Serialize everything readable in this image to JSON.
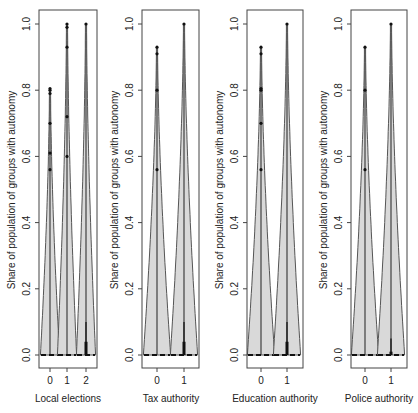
{
  "figure": {
    "ylabel": "Share of population of groups with autonomy",
    "y_ticks": [
      "0.0",
      "0.2",
      "0.4",
      "0.6",
      "0.8",
      "1.0"
    ]
  },
  "chart_data": [
    {
      "type": "violin",
      "xlabel": "Local elections",
      "ylabel": "Share of population of groups with autonomy",
      "ylim": [
        0,
        1
      ],
      "categories": [
        "0",
        "1",
        "2"
      ],
      "groups": [
        {
          "category": "0",
          "median": 0.0,
          "q1": 0.0,
          "q3": 0.0,
          "whisker_max": 0.8,
          "outliers": [
            0.56,
            0.61,
            0.7,
            0.79,
            0.8,
            0.805
          ]
        },
        {
          "category": "1",
          "median": 0.0,
          "q1": 0.0,
          "q3": 0.0,
          "whisker_max": 1.0,
          "outliers": [
            0.6,
            0.72,
            0.93,
            0.99,
            1.0
          ]
        },
        {
          "category": "2",
          "median": 0.0,
          "q1": 0.0,
          "q3": 0.04,
          "whisker_max": 1.0,
          "inner_line_max": 0.1,
          "outliers": [
            1.0
          ]
        }
      ]
    },
    {
      "type": "violin",
      "xlabel": "Tax authority",
      "ylabel": "Share of population of groups with autonomy",
      "ylim": [
        0,
        1
      ],
      "categories": [
        "0",
        "1"
      ],
      "groups": [
        {
          "category": "0",
          "median": 0.0,
          "q1": 0.0,
          "q3": 0.0,
          "whisker_max": 0.93,
          "outliers": [
            0.56,
            0.8,
            0.91,
            0.93
          ]
        },
        {
          "category": "1",
          "median": 0.0,
          "q1": 0.0,
          "q3": 0.04,
          "whisker_max": 1.0,
          "inner_line_max": 0.1,
          "outliers": [
            1.0
          ]
        }
      ]
    },
    {
      "type": "violin",
      "xlabel": "Education authority",
      "ylabel": "Share of population of groups with autonomy",
      "ylim": [
        0,
        1
      ],
      "categories": [
        "0",
        "1"
      ],
      "groups": [
        {
          "category": "0",
          "median": 0.0,
          "q1": 0.0,
          "q3": 0.0,
          "whisker_max": 0.93,
          "outliers": [
            0.56,
            0.7,
            0.8,
            0.805,
            0.91,
            0.93
          ]
        },
        {
          "category": "1",
          "median": 0.0,
          "q1": 0.0,
          "q3": 0.04,
          "whisker_max": 1.0,
          "inner_line_max": 0.1,
          "outliers": [
            1.0
          ]
        }
      ]
    },
    {
      "type": "violin",
      "xlabel": "Police authority",
      "ylabel": "Share of population of groups with autonomy",
      "ylim": [
        0,
        1
      ],
      "categories": [
        "0",
        "1"
      ],
      "groups": [
        {
          "category": "0",
          "median": 0.0,
          "q1": 0.0,
          "q3": 0.0,
          "whisker_max": 0.93,
          "outliers": [
            0.56,
            0.8,
            0.93
          ]
        },
        {
          "category": "1",
          "median": 0.0,
          "q1": 0.0,
          "q3": 0.01,
          "whisker_max": 1.0,
          "inner_line_max": 0.05,
          "outliers": [
            1.0
          ]
        }
      ]
    }
  ],
  "layout": {
    "y_top_px": 24,
    "y_bottom_px": 355,
    "frame_top": 10,
    "frame_bottom": 368,
    "panels": [
      {
        "left": 39,
        "right": 97,
        "centers": [
          50,
          67,
          86
        ],
        "halfwidth": 9,
        "label_x": 68
      },
      {
        "left": 142,
        "right": 199,
        "centers": [
          157,
          184
        ],
        "halfwidth": 13,
        "label_x": 171
      },
      {
        "left": 247,
        "right": 303,
        "centers": [
          261,
          287
        ],
        "halfwidth": 13,
        "label_x": 275
      },
      {
        "left": 351,
        "right": 407,
        "centers": [
          365,
          391
        ],
        "halfwidth": 13,
        "label_x": 379
      }
    ],
    "colors": {
      "fill": "#d9d9d9",
      "stroke": "#555555",
      "dark": "#111111",
      "frame": "#444444"
    }
  }
}
